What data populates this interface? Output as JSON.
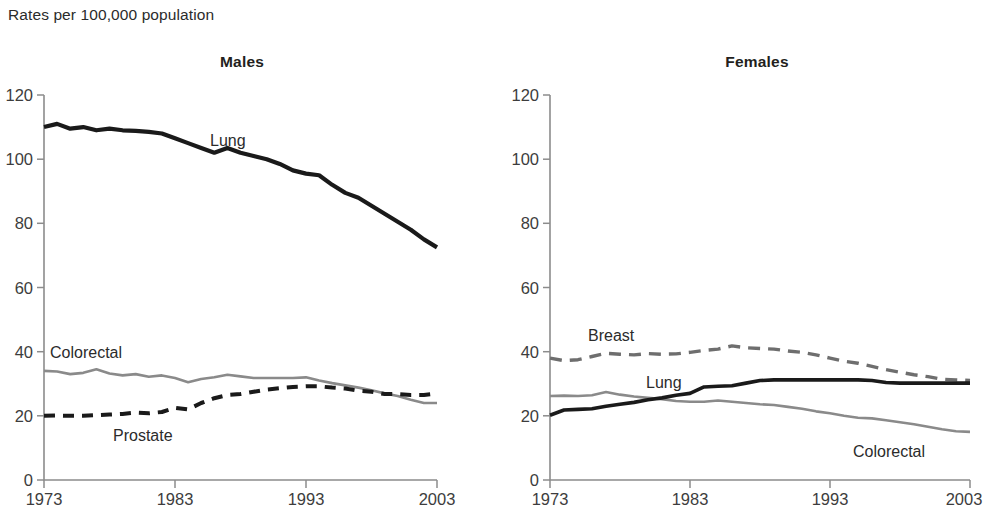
{
  "caption": "Rates per 100,000 population",
  "panels": [
    {
      "id": "males",
      "title": "Males",
      "labels": {
        "lung": "Lung",
        "colorectal": "Colorectal",
        "prostate": "Prostate"
      }
    },
    {
      "id": "females",
      "title": "Females",
      "labels": {
        "breast": "Breast",
        "lung": "Lung",
        "colorectal": "Colorectal"
      }
    }
  ],
  "axis": {
    "y_ticks": [
      "0",
      "20",
      "40",
      "60",
      "80",
      "100",
      "120"
    ],
    "x_ticks": [
      "1973",
      "1983",
      "1993",
      "2003"
    ]
  },
  "chart_data": [
    {
      "type": "line",
      "title": "Males",
      "subtitle": "Rates per 100,000 population",
      "xlabel": "",
      "ylabel": "Rates per 100,000 population",
      "xlim": [
        1973,
        2003
      ],
      "ylim": [
        0,
        120
      ],
      "xticks": [
        1973,
        1983,
        1993,
        2003
      ],
      "yticks": [
        0,
        20,
        40,
        60,
        80,
        100,
        120
      ],
      "grid": false,
      "legend": "inline-annotations",
      "x": [
        1973,
        1974,
        1975,
        1976,
        1977,
        1978,
        1979,
        1980,
        1981,
        1982,
        1983,
        1984,
        1985,
        1986,
        1987,
        1988,
        1989,
        1990,
        1991,
        1992,
        1993,
        1994,
        1995,
        1996,
        1997,
        1998,
        1999,
        2000,
        2001,
        2002,
        2003
      ],
      "series": [
        {
          "name": "Lung",
          "style": "solid-black",
          "values": [
            110.0,
            111.0,
            109.5,
            110.0,
            109.0,
            109.5,
            109.0,
            108.8,
            108.5,
            108.0,
            106.5,
            105.0,
            103.5,
            102.0,
            103.5,
            102.0,
            101.0,
            100.0,
            98.5,
            96.5,
            95.5,
            95.0,
            92.0,
            89.5,
            88.0,
            85.5,
            83.0,
            80.5,
            78.0,
            75.0,
            72.5
          ]
        },
        {
          "name": "Colorectal",
          "style": "solid-gray",
          "values": [
            34.0,
            33.8,
            33.0,
            33.4,
            34.5,
            33.2,
            32.6,
            33.0,
            32.2,
            32.6,
            31.8,
            30.5,
            31.5,
            32.0,
            32.8,
            32.3,
            31.8,
            31.8,
            31.8,
            31.8,
            32.0,
            31.0,
            30.2,
            29.5,
            28.8,
            28.0,
            27.0,
            26.2,
            25.0,
            24.0,
            24.0
          ]
        },
        {
          "name": "Prostate",
          "style": "dashed-black",
          "values": [
            20.0,
            20.1,
            20.0,
            20.0,
            20.2,
            20.4,
            20.6,
            21.0,
            20.8,
            21.2,
            22.5,
            22.0,
            24.0,
            25.5,
            26.5,
            26.8,
            27.5,
            28.2,
            28.6,
            29.0,
            29.2,
            29.2,
            28.8,
            28.5,
            27.8,
            27.5,
            26.8,
            26.8,
            26.5,
            26.5,
            27.0
          ]
        }
      ],
      "note": "Lung continues declining to about 57 at 2003; values sampled from digitized curve"
    },
    {
      "type": "line",
      "title": "Females",
      "subtitle": "Rates per 100,000 population",
      "xlabel": "",
      "ylabel": "Rates per 100,000 population",
      "xlim": [
        1973,
        2003
      ],
      "ylim": [
        0,
        120
      ],
      "xticks": [
        1973,
        1983,
        1993,
        2003
      ],
      "yticks": [
        0,
        20,
        40,
        60,
        80,
        100,
        120
      ],
      "grid": false,
      "legend": "inline-annotations",
      "x": [
        1973,
        1974,
        1975,
        1976,
        1977,
        1978,
        1979,
        1980,
        1981,
        1982,
        1983,
        1984,
        1985,
        1986,
        1987,
        1988,
        1989,
        1990,
        1991,
        1992,
        1993,
        1994,
        1995,
        1996,
        1997,
        1998,
        1999,
        2000,
        2001,
        2002,
        2003
      ],
      "series": [
        {
          "name": "Breast",
          "style": "dashed-gray",
          "values": [
            38.0,
            37.2,
            37.5,
            38.5,
            39.5,
            39.2,
            39.0,
            39.4,
            39.2,
            39.3,
            39.8,
            40.4,
            40.8,
            41.8,
            41.2,
            41.0,
            40.8,
            40.2,
            39.8,
            39.0,
            38.0,
            37.0,
            36.4,
            35.4,
            34.4,
            33.6,
            32.8,
            32.2,
            31.4,
            31.2,
            31.0
          ]
        },
        {
          "name": "Lung",
          "style": "solid-black",
          "values": [
            20.2,
            21.8,
            22.0,
            22.2,
            23.0,
            23.6,
            24.2,
            25.0,
            25.6,
            26.4,
            27.0,
            29.0,
            29.2,
            29.4,
            30.2,
            31.0,
            31.2,
            31.2,
            31.2,
            31.2,
            31.2,
            31.2,
            31.2,
            31.0,
            30.4,
            30.2,
            30.2,
            30.2,
            30.2,
            30.2,
            30.2
          ]
        },
        {
          "name": "Colorectal",
          "style": "solid-gray",
          "values": [
            26.2,
            26.3,
            26.2,
            26.4,
            27.4,
            26.6,
            26.0,
            25.6,
            25.2,
            24.6,
            24.4,
            24.4,
            24.8,
            24.4,
            24.0,
            23.6,
            23.4,
            22.8,
            22.2,
            21.4,
            20.8,
            20.0,
            19.4,
            19.2,
            18.6,
            18.0,
            17.4,
            16.6,
            15.8,
            15.2,
            15.0
          ]
        }
      ]
    }
  ]
}
